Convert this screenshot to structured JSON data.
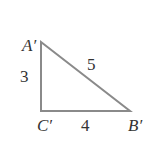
{
  "diagram": {
    "type": "right-triangle",
    "vertices": {
      "A": {
        "label": "A′",
        "x": 41,
        "y": 42
      },
      "C": {
        "label": "C′",
        "x": 41,
        "y": 111
      },
      "B": {
        "label": "B′",
        "x": 130,
        "y": 111
      }
    },
    "sides": {
      "AC": "3",
      "CB": "4",
      "AB": "5"
    },
    "colors": {
      "line": "#8a8a8a",
      "text": "#333333",
      "background": "#ffffff"
    }
  }
}
